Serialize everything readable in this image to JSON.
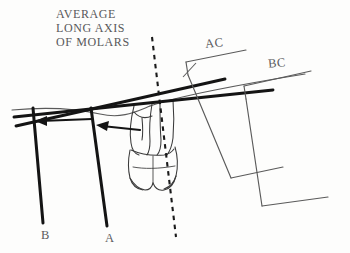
{
  "figure": {
    "title_caption": {
      "line1": "AVERAGE",
      "line2": "LONG AXIS",
      "line3": "OF MOLARS"
    },
    "labels": {
      "ac": "AC",
      "bc": "BC",
      "b": "B",
      "a": "A"
    },
    "colors": {
      "ink": "#1a1a1a",
      "thin_ink": "#4a4a4a",
      "text": "#58585a",
      "background": "#fdfdfc"
    },
    "elements": {
      "occlusal_plane": "thin curved reference line across upper area",
      "average_long_axis_of_molars": "dashed line running top-left to bottom-right through the molar",
      "molar_outline": "line drawing of a lower molar, roots upward, crown downward",
      "vertical_reference_b": "thick vertical line labeled B",
      "vertical_reference_a": "thick vertical line labeled A",
      "arrow_b": "leftward arrow terminating at line B",
      "arrow_a": "leftward arrow terminating at line A",
      "bracket_ac": "angled bracket on the right labeled AC",
      "bracket_bc": "angled bracket on the far right labeled BC",
      "thick_line_upper": "thick straight line passing through the molar toward AC",
      "thick_line_lower": "thick straight line passing through the molar toward BC"
    }
  }
}
